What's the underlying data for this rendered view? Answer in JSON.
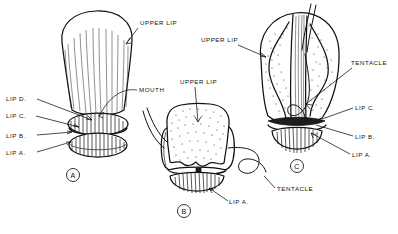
{
  "plate": {
    "type": "scientific-line-illustration",
    "subject": "Comparative views of mouthparts: upper lip, lips A-D, mouth and tentacles",
    "background_color": "#ffffff",
    "ink_color": "#111111",
    "figure_count": 3
  },
  "figures": [
    {
      "id": "A",
      "marker": "A",
      "position": "left",
      "style": "vertically striated dome, three stacked lip rings below",
      "labels": [
        {
          "key": "upper_lip",
          "text": "UPPER LIP",
          "side": "right"
        },
        {
          "key": "mouth",
          "text": "MOUTH",
          "side": "right"
        },
        {
          "key": "lip_d",
          "text": "LIP D.",
          "side": "left"
        },
        {
          "key": "lip_c",
          "text": "LIP C.",
          "side": "left"
        },
        {
          "key": "lip_b",
          "text": "LIP B.",
          "side": "left"
        },
        {
          "key": "lip_a",
          "text": "LIP A.",
          "side": "left"
        }
      ]
    },
    {
      "id": "B",
      "marker": "B",
      "position": "center",
      "style": "stippled anvil-shaped upper lip with scalloped base, tentacles at left and right",
      "labels": [
        {
          "key": "upper_lip",
          "text": "UPPER LIP",
          "side": "top"
        },
        {
          "key": "tentacle",
          "text": "TENTACLE",
          "side": "right"
        },
        {
          "key": "lip_a",
          "text": "LIP A.",
          "side": "right"
        }
      ]
    },
    {
      "id": "C",
      "marker": "C",
      "position": "right",
      "style": "stippled ovoid head with central striated band, coiled tentacle, lip rings below",
      "labels": [
        {
          "key": "upper_lip",
          "text": "UPPER LIP",
          "side": "left"
        },
        {
          "key": "tentacle",
          "text": "TENTACLE",
          "side": "right"
        },
        {
          "key": "lip_c",
          "text": "LIP C.",
          "side": "right"
        },
        {
          "key": "lip_b",
          "text": "LIP B.",
          "side": "right"
        },
        {
          "key": "lip_a",
          "text": "LIP A.",
          "side": "right"
        }
      ]
    }
  ],
  "glossary": {
    "upper_lip": "UPPER LIP",
    "mouth": "MOUTH",
    "tentacle": "TENTACLE",
    "lip_a": "LIP A.",
    "lip_b": "LIP B.",
    "lip_c": "LIP C.",
    "lip_d": "LIP D."
  }
}
